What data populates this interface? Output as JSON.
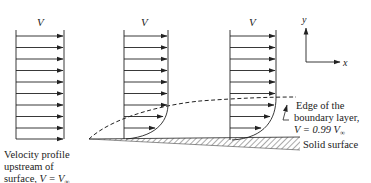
{
  "diagram": {
    "profile_labels": [
      "V",
      "V",
      "V"
    ],
    "upstream_label": {
      "line1": "Velocity profile",
      "line2": "upstream of",
      "line3_prefix": "surface, ",
      "line3_math": "V = V",
      "line3_sub": "∞"
    },
    "edge_label": {
      "line1": "Edge of the",
      "line2": "boundary layer,",
      "line3_math": "V = 0.99 V",
      "line3_sub": "∞"
    },
    "surface_label": "Solid surface",
    "axes": {
      "x": "x",
      "y": "y"
    },
    "colors": {
      "line": "#222222",
      "hatch": "#555555"
    }
  }
}
